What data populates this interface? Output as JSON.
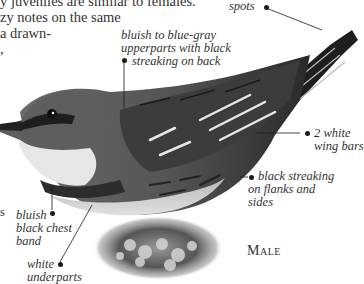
{
  "page": {
    "body_text_lines": [
      "y juveniles are similar to females.",
      "zy notes on the same",
      " a drawn-",
      ","
    ],
    "subject_label": "Male",
    "callouts": {
      "spots": "spots",
      "upperparts": [
        "bluish to blue-gray",
        "upperparts with black",
        "streaking on back"
      ],
      "wing_bars": [
        "2 white",
        "wing bars"
      ],
      "flanks": [
        "black streaking",
        "on flanks and",
        "sides"
      ],
      "chest_band": [
        "bluish",
        "black chest",
        "band"
      ],
      "underparts": [
        "white",
        "underparts"
      ],
      "left_margin_fragment": "s"
    }
  },
  "colors": {
    "text": "#333333",
    "leader_line": "#1a1a1a",
    "background": "#ffffff"
  }
}
